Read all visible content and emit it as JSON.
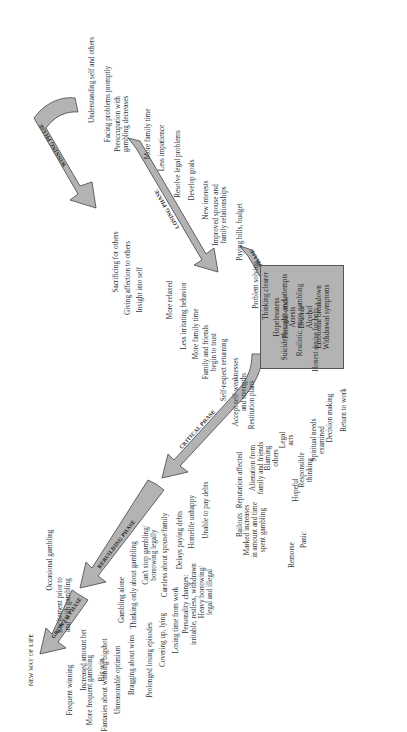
{
  "diagram": {
    "type": "gambling-recovery-phases-chart",
    "orientation": "rotated-90-ccw",
    "arrow_fill": "#b3b3b3",
    "arrow_stroke": "#444444",
    "endpoint": "NEW WAY OF LIFE",
    "phases": {
      "winning": {
        "name": "WINNING PHASE",
        "above": [
          "Occasional gambling",
          "Excitement prior to\nand with gambling",
          "Increased amount bet",
          "Big win"
        ],
        "below": [
          "Frequent winning",
          "More frequent gambling",
          "Fantasies about winning/bigshot",
          "Unreasonable optimism",
          "Bragging about wins"
        ]
      },
      "losing": {
        "name": "LOSING PHASE",
        "above": [
          "Gambling alone",
          "Thinking only about gambling",
          "Can't stop gambling/\nborrowing legally",
          "Careless about spouse/family",
          "Delays paying debts",
          "Homelife unhappy",
          "Unable to pay debts"
        ],
        "below": [
          "Prolonged losing episodes",
          "Covering up, lying",
          "Losing time from work",
          "Personality changes:\nirritable, restless, withdrawn",
          "Heavy borrowing/\nlegal and illegal"
        ]
      },
      "desperation": {
        "name": "DESPERATION PHASE",
        "above": [
          "Reputation affected",
          "Alienation from\nfamily and friends",
          "Blaming\nothers",
          "Legal\nacts"
        ],
        "below": [
          "Bailouts",
          "Marked increases\nin amount and time\nspent gambling",
          "Remorse",
          "Panic"
        ]
      },
      "crisis": {
        "items": [
          "Hopelessness",
          "Suicide thoughts and attempts",
          "Arrests",
          "Divorce",
          "Alcohol",
          "Emotional breakdown",
          "Withdrawal symptoms"
        ]
      },
      "critical": {
        "name": "CRITICAL PHASE",
        "left": [
          "Hopeful",
          "Responsible\nthinking",
          "Spiritual needs\nexamined",
          "Decision making",
          "Return to work"
        ],
        "right": [
          "Honest desire for help",
          "Realistic, stops gambling",
          "Personal stock",
          "Thinking clearer",
          "Problem solving"
        ]
      },
      "rebuilding": {
        "name": "REBUILDING PHASE",
        "left": [
          "Restitution plans",
          "Accept self-weaknesses\nand strengths",
          "Self-respect returning",
          "Family and friends\nbegin to trust",
          "More family time",
          "Less irritating behavior",
          "More relaxed"
        ],
        "right": [
          "Paying bills, budget",
          "Improved spouse and\nfamily relationships",
          "New interests",
          "Develop goals",
          "Resolve legal problems",
          "Less impatience",
          "More family time"
        ]
      },
      "growth": {
        "name": "GROWTH PHASE",
        "left": [
          "Insight into self",
          "Giving affection to others",
          "Sacrificing for others"
        ],
        "right": [
          "Preoccupation with\ngambling decreases",
          "Facing problems promptly",
          "Understanding self and others"
        ]
      }
    }
  }
}
